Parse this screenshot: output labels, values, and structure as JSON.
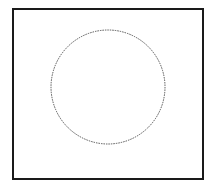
{
  "diagram": {
    "frame": {
      "stroke": "#1a1a1a"
    },
    "circle": {
      "cx": 108,
      "cy": 87,
      "r": 57,
      "stroke": "#555555",
      "style": "dotted"
    }
  }
}
